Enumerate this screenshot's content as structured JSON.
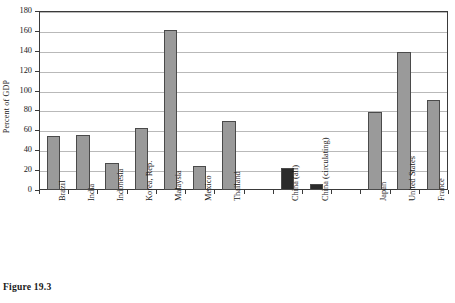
{
  "figure": {
    "caption": "Figure 19.3"
  },
  "chart_data": {
    "type": "bar",
    "title": "",
    "subtitle": "",
    "xlabel": "",
    "ylabel": "Percent of GDP",
    "ylim": [
      0,
      180
    ],
    "ytick_labels": [
      "0",
      "20",
      "40",
      "60",
      "80",
      "100",
      "120",
      "140",
      "160",
      "180"
    ],
    "ytick_values": [
      0,
      20,
      40,
      60,
      80,
      100,
      120,
      140,
      160,
      180
    ],
    "grid": true,
    "legend": "none",
    "bar_color_default": "#9a9a9a",
    "bar_color_highlight": "#2b2b2b",
    "slot_count": 14,
    "categories": [
      "Brazil",
      "India",
      "Indonesia",
      "Korea, Rep.",
      "Malaysia",
      "Mexico",
      "Thailand",
      "",
      "China (all)",
      "China (circulating)",
      "",
      "Japan",
      "United States",
      "France"
    ],
    "values": [
      54,
      55,
      27,
      62,
      161,
      24,
      69,
      null,
      22,
      6,
      null,
      78,
      139,
      91
    ],
    "bars": [
      {
        "slot": 0,
        "label": "Brazil",
        "value": 54,
        "color": "#9a9a9a"
      },
      {
        "slot": 1,
        "label": "India",
        "value": 55,
        "color": "#9a9a9a"
      },
      {
        "slot": 2,
        "label": "Indonesia",
        "value": 27,
        "color": "#9a9a9a"
      },
      {
        "slot": 3,
        "label": "Korea, Rep.",
        "value": 62,
        "color": "#9a9a9a"
      },
      {
        "slot": 4,
        "label": "Malaysia",
        "value": 161,
        "color": "#9a9a9a"
      },
      {
        "slot": 5,
        "label": "Mexico",
        "value": 24,
        "color": "#9a9a9a"
      },
      {
        "slot": 6,
        "label": "Thailand",
        "value": 69,
        "color": "#9a9a9a"
      },
      {
        "slot": 8,
        "label": "China (all)",
        "value": 22,
        "color": "#2b2b2b"
      },
      {
        "slot": 9,
        "label": "China (circulating)",
        "value": 6,
        "color": "#2b2b2b"
      },
      {
        "slot": 11,
        "label": "Japan",
        "value": 78,
        "color": "#9a9a9a"
      },
      {
        "slot": 12,
        "label": "United States",
        "value": 139,
        "color": "#9a9a9a"
      },
      {
        "slot": 13,
        "label": "France",
        "value": 91,
        "color": "#9a9a9a"
      }
    ]
  }
}
